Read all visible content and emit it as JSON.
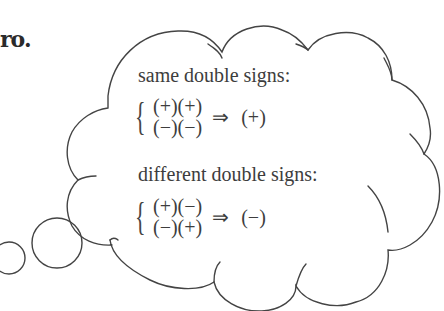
{
  "fragment": "ro.",
  "cloud": {
    "stroke_color": "#444444",
    "fill_color": "#ffffff"
  },
  "same": {
    "heading": "same double signs:",
    "pairs": [
      "(+)(+)",
      "(−)(−)"
    ],
    "arrow": "⇒",
    "result": "(+)"
  },
  "different": {
    "heading": "different double signs:",
    "pairs": [
      "(+)(−)",
      "(−)(+)"
    ],
    "arrow": "⇒",
    "result": "(−)"
  }
}
